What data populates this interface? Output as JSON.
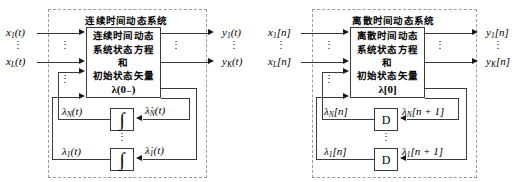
{
  "figure": {
    "type": "block-diagram",
    "ellipsis": "⋮"
  },
  "panels": [
    {
      "id": "continuous",
      "title": "连续时间动态系统",
      "system_block": {
        "lines": [
          "连续时间动态",
          "系统状态方程",
          "和",
          "初始状态矢量"
        ],
        "state_vector": "λ(0₋)"
      },
      "inputs": [
        {
          "label_base": "x",
          "label_sub": "1",
          "label_arg": "(t)"
        },
        {
          "label_base": "x",
          "label_sub": "L",
          "label_arg": "(t)"
        }
      ],
      "outputs": [
        {
          "label_base": "y",
          "label_sub": "1",
          "label_arg": "(t)"
        },
        {
          "label_base": "y",
          "label_sub": "K",
          "label_arg": "(t)"
        }
      ],
      "operators": [
        {
          "glyph": "∫",
          "kind": "integrator",
          "state_out_base": "λ",
          "state_out_sub": "N",
          "state_out_arg": "(t)",
          "state_in_base": "λ̇",
          "state_in_sub": "N",
          "state_in_arg": "(t)"
        },
        {
          "glyph": "∫",
          "kind": "integrator",
          "state_out_base": "λ",
          "state_out_sub": "1",
          "state_out_arg": "(t)",
          "state_in_base": "λ̇",
          "state_in_sub": "1",
          "state_in_arg": "(t)"
        }
      ]
    },
    {
      "id": "discrete",
      "title": "离散时间动态系统",
      "system_block": {
        "lines": [
          "离散时间动态",
          "系统状态方程",
          "和",
          "初始状态矢量"
        ],
        "state_vector": "λ[0]"
      },
      "inputs": [
        {
          "label_base": "x",
          "label_sub": "1",
          "label_arg": "[n]"
        },
        {
          "label_base": "x",
          "label_sub": "L",
          "label_arg": "[n]"
        }
      ],
      "outputs": [
        {
          "label_base": "y",
          "label_sub": "1",
          "label_arg": "[n]"
        },
        {
          "label_base": "y",
          "label_sub": "K",
          "label_arg": "[n]"
        }
      ],
      "operators": [
        {
          "glyph": "D",
          "kind": "delay",
          "state_out_base": "λ",
          "state_out_sub": "N",
          "state_out_arg": "[n]",
          "state_in_base": "λ",
          "state_in_sub": "N",
          "state_in_arg": "[n + 1]"
        },
        {
          "glyph": "D",
          "kind": "delay",
          "state_out_base": "λ",
          "state_out_sub": "1",
          "state_out_arg": "[n]",
          "state_in_base": "λ",
          "state_in_sub": "1",
          "state_in_arg": "[n + 1]"
        }
      ]
    }
  ],
  "colors": {
    "line": "#3a3a3a",
    "dashed_border": "#9a9a9a",
    "text": "#000000",
    "background": "#ffffff"
  }
}
